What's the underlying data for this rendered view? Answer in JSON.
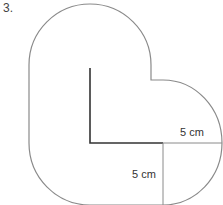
{
  "question_number": "3.",
  "labels": {
    "horizontal_radius": "5 cm",
    "vertical_radius": "5 cm"
  },
  "colors": {
    "outline": "#8a8a8a",
    "l_shape": "#333333",
    "text": "#333333"
  }
}
